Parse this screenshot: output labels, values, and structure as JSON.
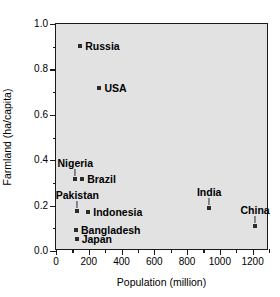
{
  "chart_data": {
    "type": "scatter",
    "title": "",
    "xlabel": "Population (million)",
    "ylabel": "Farmland (ha/capita)",
    "xlim": [
      0,
      1300
    ],
    "ylim": [
      0.0,
      1.0
    ],
    "xticks": [
      0,
      200,
      400,
      600,
      800,
      1000,
      1200
    ],
    "xticklabels": [
      "0",
      "200",
      "400",
      "600",
      "800",
      "1000",
      "1200"
    ],
    "xminorticks": [
      100,
      300,
      500,
      700,
      900,
      1100,
      1300
    ],
    "yticks": [
      0.0,
      0.2,
      0.4,
      0.6,
      0.8,
      1.0
    ],
    "yticklabels": [
      "0.0",
      "0.2",
      "0.4",
      "0.6",
      "0.8",
      "1.0"
    ],
    "yminorticks": [
      0.1,
      0.3,
      0.5,
      0.7,
      0.9
    ],
    "grid": false,
    "legend": null,
    "marker": "square",
    "marker_color": "#2b2b2b",
    "plot_background": "#e2e2e2",
    "points": [
      {
        "label": "Russia",
        "x": 148,
        "y": 0.905,
        "label_pos": "right"
      },
      {
        "label": "USA",
        "x": 265,
        "y": 0.72,
        "label_pos": "right"
      },
      {
        "label": "Nigeria",
        "x": 118,
        "y": 0.318,
        "label_pos": "above"
      },
      {
        "label": "Brazil",
        "x": 160,
        "y": 0.315,
        "label_pos": "right"
      },
      {
        "label": "Pakistan",
        "x": 130,
        "y": 0.175,
        "label_pos": "above"
      },
      {
        "label": "Indonesia",
        "x": 197,
        "y": 0.172,
        "label_pos": "right"
      },
      {
        "label": "Bangladesh",
        "x": 122,
        "y": 0.093,
        "label_pos": "right"
      },
      {
        "label": "Japan",
        "x": 126,
        "y": 0.053,
        "label_pos": "right"
      },
      {
        "label": "India",
        "x": 935,
        "y": 0.188,
        "label_pos": "above"
      },
      {
        "label": "China",
        "x": 1215,
        "y": 0.108,
        "label_pos": "above"
      }
    ]
  }
}
